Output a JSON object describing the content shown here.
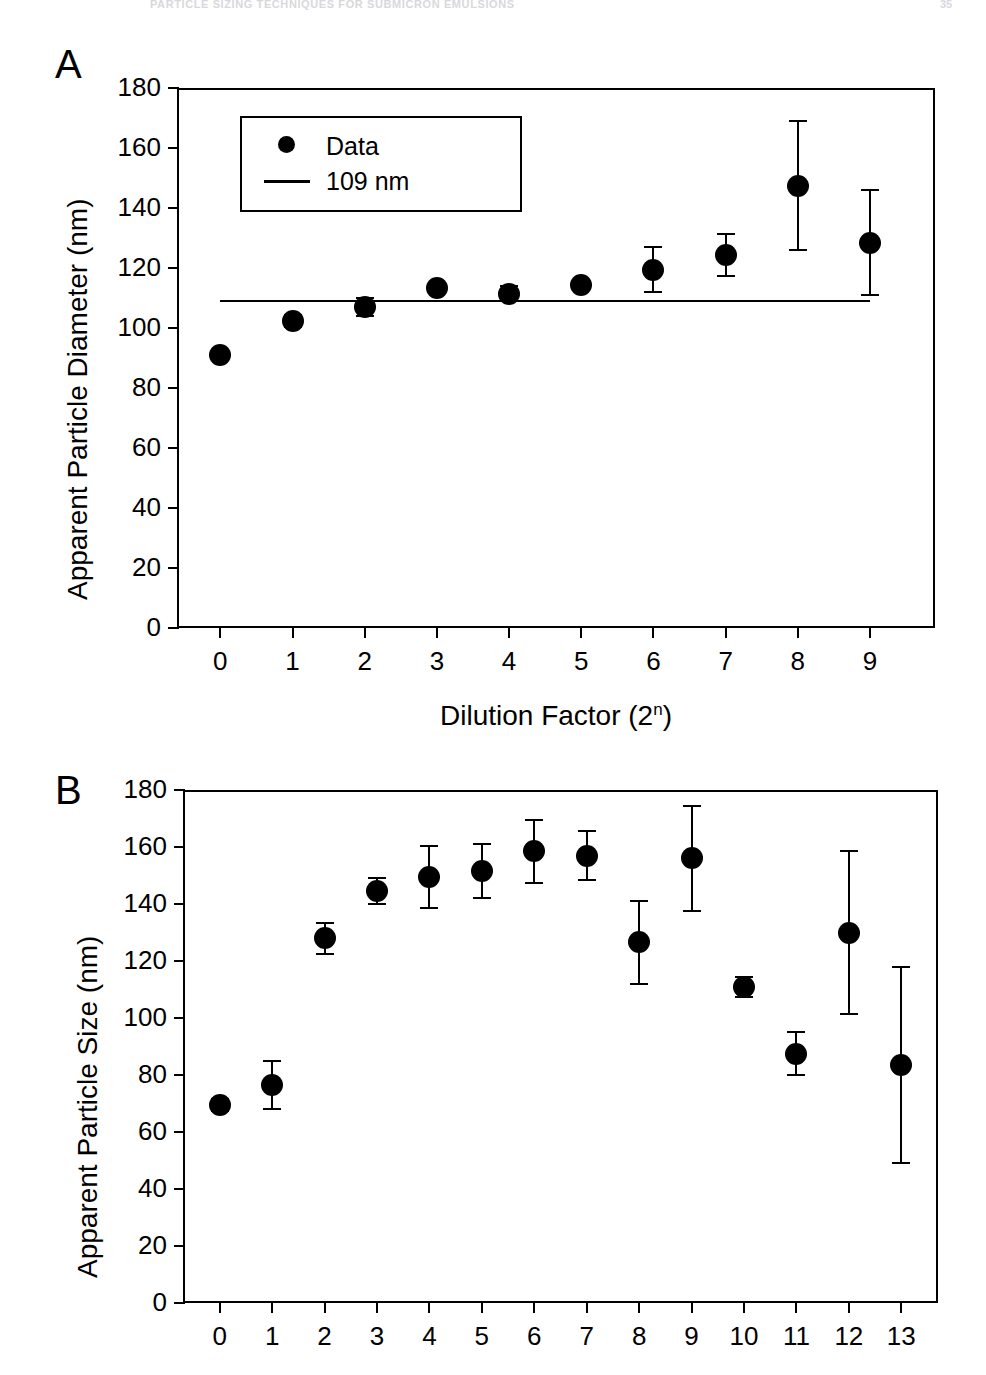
{
  "running_head": {
    "title": "PARTICLE SIZING TECHNIQUES FOR SUBMICRON EMULSIONS",
    "page": "35"
  },
  "figure": {
    "panels": [
      {
        "letter": "A"
      },
      {
        "letter": "B"
      }
    ]
  },
  "chart_data": [
    {
      "panel": "A",
      "type": "scatter",
      "title": "",
      "xlabel": "Dilution Factor (2",
      "xlabel_sup": "n",
      "xlabel_suffix": ")",
      "xlabel_full": "Dilution Factor (2n)",
      "ylabel": "Apparent Particle Diameter (nm)",
      "xlim": [
        -0.6,
        9.9
      ],
      "ylim": [
        0,
        180
      ],
      "yticks": [
        0,
        20,
        40,
        60,
        80,
        100,
        120,
        140,
        160,
        180
      ],
      "xticks": [
        0,
        1,
        2,
        3,
        4,
        5,
        6,
        7,
        8,
        9
      ],
      "xtick_labels": [
        "0",
        "1",
        "2",
        "3",
        "4",
        "5",
        "6",
        "7",
        "8",
        "9"
      ],
      "ytick_labels": [
        "0",
        "20",
        "40",
        "60",
        "80",
        "100",
        "120",
        "140",
        "160",
        "180"
      ],
      "grid": false,
      "frame": "full-box",
      "legend": {
        "position": "upper-left-inset",
        "entries": [
          {
            "marker": "filled-circle",
            "label": "Data"
          },
          {
            "marker": "line",
            "label": "109 nm"
          }
        ]
      },
      "reference_line": {
        "value": 109,
        "label": "109 nm",
        "x_start": 0,
        "x_end": 9
      },
      "x": [
        0,
        1,
        2,
        3,
        4,
        5,
        6,
        7,
        8,
        9
      ],
      "values": [
        91.0,
        102.5,
        107.0,
        113.5,
        111.5,
        114.5,
        119.5,
        124.5,
        147.5,
        128.5
      ],
      "errors": [
        0.0,
        2.0,
        3.0,
        0.0,
        2.5,
        1.5,
        7.5,
        7.0,
        21.5,
        17.5
      ]
    },
    {
      "panel": "B",
      "type": "scatter",
      "title": "",
      "xlabel": "",
      "ylabel": "Apparent Particle Size (nm)",
      "xlim": [
        -0.7,
        13.7
      ],
      "ylim": [
        0,
        180
      ],
      "yticks": [
        0,
        20,
        40,
        60,
        80,
        100,
        120,
        140,
        160,
        180
      ],
      "xticks": [
        0,
        1,
        2,
        3,
        4,
        5,
        6,
        7,
        8,
        9,
        10,
        11,
        12,
        13
      ],
      "xtick_labels": [
        "0",
        "1",
        "2",
        "3",
        "4",
        "5",
        "6",
        "7",
        "8",
        "9",
        "10",
        "11",
        "12",
        "13"
      ],
      "ytick_labels": [
        "0",
        "20",
        "40",
        "60",
        "80",
        "100",
        "120",
        "140",
        "160",
        "180"
      ],
      "grid": false,
      "frame": "full-box",
      "x": [
        0,
        1,
        2,
        3,
        4,
        5,
        6,
        7,
        8,
        9,
        10,
        11,
        12,
        13
      ],
      "values": [
        69.5,
        76.5,
        128.0,
        144.5,
        149.5,
        151.5,
        158.5,
        157.0,
        126.5,
        156.0,
        111.0,
        87.5,
        130.0,
        83.5
      ],
      "errors": [
        2.0,
        8.5,
        5.5,
        4.5,
        11.0,
        9.5,
        11.0,
        8.5,
        14.5,
        18.5,
        3.5,
        7.5,
        28.5,
        34.5
      ]
    }
  ],
  "colors": {
    "ink": "#000000",
    "paper": "#ffffff"
  }
}
